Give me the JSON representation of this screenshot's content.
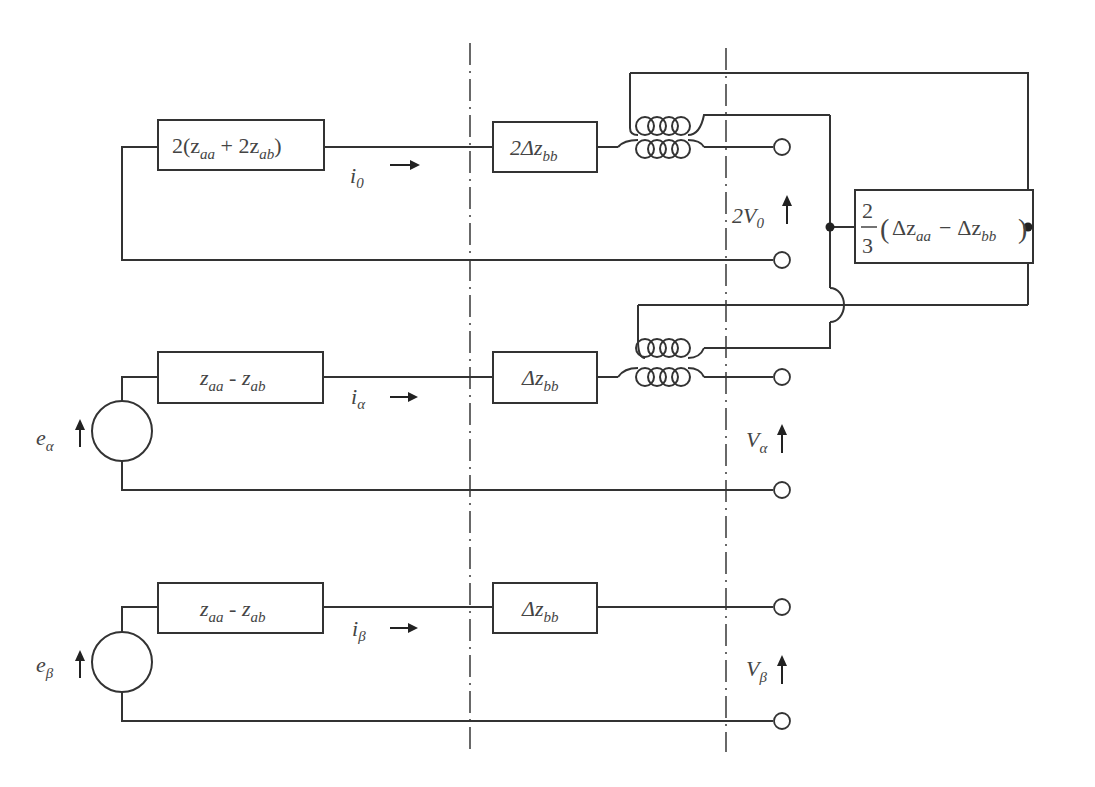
{
  "diagram": {
    "type": "equivalent-circuit",
    "sections": [
      {
        "id": "zero-sequence",
        "impedance_box_1": {
          "prefix": "2(z",
          "sub1": "aa",
          "mid": " + 2z",
          "sub2": "ab",
          "suffix": ")"
        },
        "current": {
          "symbol": "i",
          "sub": "0",
          "arrow": "→"
        },
        "impedance_box_2": {
          "prefix": "2Δz",
          "sub": "bb"
        },
        "voltage": {
          "symbol": "2V",
          "sub": "0",
          "arrow": "↑"
        },
        "has_transformer": true
      },
      {
        "id": "alpha",
        "source": {
          "symbol": "e",
          "sub": "α",
          "arrow": "↑"
        },
        "impedance_box_1": {
          "prefix": "z",
          "sub1": "aa",
          "mid": " - z",
          "sub2": "ab"
        },
        "current": {
          "symbol": "i",
          "sub": "α",
          "arrow": "→"
        },
        "impedance_box_2": {
          "prefix": "Δz",
          "sub": "bb"
        },
        "voltage": {
          "symbol": "V",
          "sub": "α",
          "arrow": "↑"
        },
        "has_transformer": true
      },
      {
        "id": "beta",
        "source": {
          "symbol": "e",
          "sub": "β",
          "arrow": "↑"
        },
        "impedance_box_1": {
          "prefix": "z",
          "sub1": "aa",
          "mid": " - z",
          "sub2": "ab"
        },
        "current": {
          "symbol": "i",
          "sub": "β",
          "arrow": "→"
        },
        "impedance_box_2": {
          "prefix": "Δz",
          "sub": "bb"
        },
        "voltage": {
          "symbol": "V",
          "sub": "β",
          "arrow": "↑"
        },
        "has_transformer": false
      }
    ],
    "coupling_impedance": {
      "numerator": "2",
      "denominator": "3",
      "open": "(",
      "term1": "Δz",
      "term1_sub": "aa",
      "minus": "−",
      "term2": "Δz",
      "term2_sub": "bb",
      "close": ")"
    },
    "boundaries": [
      "dash-dot-left",
      "dash-dot-right"
    ]
  }
}
